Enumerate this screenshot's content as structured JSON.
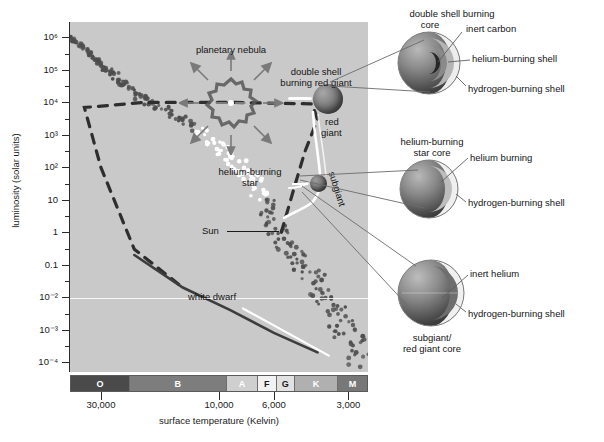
{
  "figure": {
    "type": "hr-diagram"
  },
  "axes": {
    "y": {
      "title": "luminosity (solar units)",
      "ticks": [
        "10⁶",
        "10⁵",
        "10⁴",
        "10³",
        "10²",
        "10",
        "1",
        "0.1",
        "10⁻²",
        "10⁻³",
        "10⁻⁴"
      ],
      "tick_values": [
        1000000,
        100000,
        10000,
        1000,
        100,
        10,
        1,
        0.1,
        0.01,
        0.001,
        0.0001
      ]
    },
    "x": {
      "title": "surface temperature (Kelvin)",
      "ticks": [
        "30,000",
        "10,000",
        "6,000",
        "3,000"
      ],
      "tick_values": [
        30000,
        10000,
        6000,
        3000
      ]
    }
  },
  "spectral_classes": [
    {
      "label": "O",
      "color": "#4a4a4a",
      "text_color": "#ffffff"
    },
    {
      "label": "B",
      "color": "#7d7d7d",
      "text_color": "#ffffff"
    },
    {
      "label": "A",
      "color": "#cfcfcf",
      "text_color": "#ffffff"
    },
    {
      "label": "F",
      "color": "#f2f2f2",
      "text_color": "#1a1a1a"
    },
    {
      "label": "G",
      "color": "#e2e2e2",
      "text_color": "#1a1a1a"
    },
    {
      "label": "K",
      "color": "#b0b0b0",
      "text_color": "#ffffff"
    },
    {
      "label": "M",
      "color": "#787878",
      "text_color": "#ffffff"
    }
  ],
  "plot_labels": {
    "planetary_nebula": "planetary nebula",
    "double_shell_line1": "double shell",
    "double_shell_line2": "burning red giant",
    "red_giant_line1": "red",
    "red_giant_line2": "giant",
    "helium_burning_line1": "helium-burning",
    "helium_burning_line2": "star",
    "subgiant": "subgiant",
    "sun": "Sun",
    "white_dwarf": "white dwarf"
  },
  "cross_sections": [
    {
      "id": "double-shell-burning-core",
      "title_line1": "double shell burning",
      "title_line2": "core",
      "callouts": [
        "inert carbon",
        "helium-burning shell",
        "hydrogen-burning shell"
      ]
    },
    {
      "id": "helium-burning-star-core",
      "title_line1": "helium-burning",
      "title_line2": "star core",
      "callouts": [
        "helium burning",
        "hydrogen-burning shell"
      ]
    },
    {
      "id": "subgiant-red-giant-core",
      "title_line1": "subgiant/",
      "title_line2": "red giant core",
      "callouts": [
        "inert helium",
        "hydrogen-burning shell"
      ]
    }
  ],
  "colors": {
    "plot_background": "#c9c9c9",
    "page_background": "#ffffff",
    "axis": "#2b2b2b",
    "text": "#1a1a1a",
    "main_sequence_dot": "#4e4e4e",
    "bright_dot": "#ffffff",
    "track_dashed": "#2e2e2e",
    "white_dwarf_track": "#3d3d3d"
  },
  "chart_data": {
    "type": "scatter",
    "xlabel": "surface temperature (Kelvin)",
    "ylabel": "luminosity (solar units)",
    "xlim": [
      40000,
      2500
    ],
    "ylim": [
      5e-05,
      3000000
    ],
    "grid": false,
    "legend": null,
    "series": [
      {
        "name": "main sequence",
        "note": "dotted band running from hot/luminous upper-left to cool/faint lower-right",
        "points": [
          {
            "x": 40000,
            "y": 1000000
          },
          {
            "x": 34000,
            "y": 400000
          },
          {
            "x": 30000,
            "y": 150000
          },
          {
            "x": 26000,
            "y": 60000
          },
          {
            "x": 22000,
            "y": 20000
          },
          {
            "x": 18000,
            "y": 8000
          },
          {
            "x": 14000,
            "y": 2500
          },
          {
            "x": 11000,
            "y": 700
          },
          {
            "x": 9000,
            "y": 200
          },
          {
            "x": 7500,
            "y": 50
          },
          {
            "x": 6600,
            "y": 10
          },
          {
            "x": 5800,
            "y": 1
          },
          {
            "x": 5000,
            "y": 0.2
          },
          {
            "x": 4200,
            "y": 0.04
          },
          {
            "x": 3500,
            "y": 0.006
          },
          {
            "x": 3000,
            "y": 0.0008
          },
          {
            "x": 2700,
            "y": 0.0001
          }
        ]
      },
      {
        "name": "post-main-sequence evolutionary track",
        "style": "dashed",
        "note": "track from main sequence turnoff rising to red giant branch, then blueward to planetary nebula and down to white dwarf",
        "points": [
          {
            "x": 5600,
            "y": 1
          },
          {
            "x": 5000,
            "y": 20
          },
          {
            "x": 4500,
            "y": 300
          },
          {
            "x": 4000,
            "y": 3000
          },
          {
            "x": 4200,
            "y": 9000
          },
          {
            "x": 9000,
            "y": 10000
          },
          {
            "x": 20000,
            "y": 10000
          },
          {
            "x": 35000,
            "y": 7000
          },
          {
            "x": 30000,
            "y": 100
          },
          {
            "x": 22000,
            "y": 0.3
          },
          {
            "x": 14000,
            "y": 0.02
          }
        ]
      },
      {
        "name": "white dwarf cooling track",
        "style": "solid",
        "points": [
          {
            "x": 22000,
            "y": 0.2
          },
          {
            "x": 14000,
            "y": 0.02
          },
          {
            "x": 9000,
            "y": 0.004
          },
          {
            "x": 6000,
            "y": 0.0008
          },
          {
            "x": 4000,
            "y": 0.0002
          }
        ]
      }
    ],
    "annotations": [
      {
        "text": "planetary nebula",
        "x": 16000,
        "y": 40000
      },
      {
        "text": "double shell burning red giant",
        "x": 4500,
        "y": 12000
      },
      {
        "text": "red giant",
        "x": 3600,
        "y": 1500
      },
      {
        "text": "helium-burning star",
        "x": 6000,
        "y": 80
      },
      {
        "text": "subgiant",
        "x": 3800,
        "y": 8
      },
      {
        "text": "Sun",
        "x": 9000,
        "y": 1
      },
      {
        "text": "white dwarf",
        "x": 12000,
        "y": 0.004
      }
    ]
  }
}
